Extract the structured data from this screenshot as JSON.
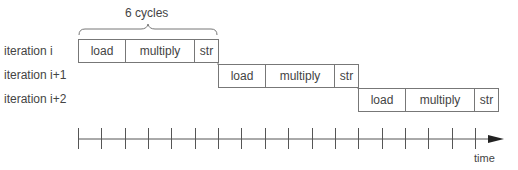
{
  "brace_label": "6 cycles",
  "rows": [
    {
      "label": "iteration i",
      "stages": [
        {
          "name": "load",
          "cycles": 2
        },
        {
          "name": "multiply",
          "cycles": 3
        },
        {
          "name": "str",
          "cycles": 1
        }
      ]
    },
    {
      "label": "iteration i+1",
      "stages": [
        {
          "name": "load",
          "cycles": 2
        },
        {
          "name": "multiply",
          "cycles": 3
        },
        {
          "name": "str",
          "cycles": 1
        }
      ]
    },
    {
      "label": "iteration i+2",
      "stages": [
        {
          "name": "load",
          "cycles": 2
        },
        {
          "name": "multiply",
          "cycles": 3
        },
        {
          "name": "str",
          "cycles": 1
        }
      ]
    }
  ],
  "axis": {
    "label": "time",
    "tick_count": 18
  }
}
